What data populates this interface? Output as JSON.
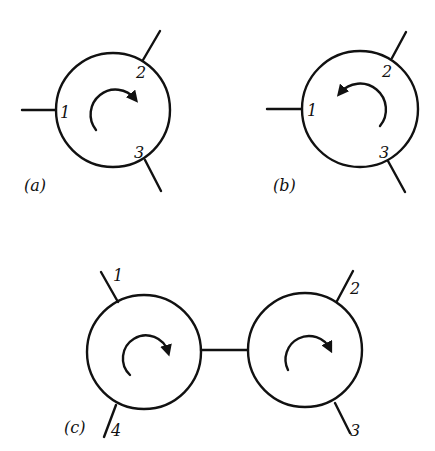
{
  "diagram": {
    "panels": [
      {
        "caption": "(a)",
        "circulator": {
          "rotation": "clockwise",
          "ports": [
            {
              "label": "1"
            },
            {
              "label": "2"
            },
            {
              "label": "3"
            }
          ]
        }
      },
      {
        "caption": "(b)",
        "circulator": {
          "rotation": "counterclockwise",
          "ports": [
            {
              "label": "1"
            },
            {
              "label": "2"
            },
            {
              "label": "3"
            }
          ]
        }
      },
      {
        "caption": "(c)",
        "circulators": [
          {
            "rotation": "clockwise",
            "ports": [
              {
                "label": "1"
              },
              {
                "label": "4"
              }
            ]
          },
          {
            "rotation": "clockwise",
            "ports": [
              {
                "label": "2"
              },
              {
                "label": "3"
              }
            ]
          }
        ],
        "connection": "left circulator joined to right circulator by a line"
      }
    ],
    "colors": {
      "stroke": "#111111",
      "background": "#ffffff"
    }
  }
}
